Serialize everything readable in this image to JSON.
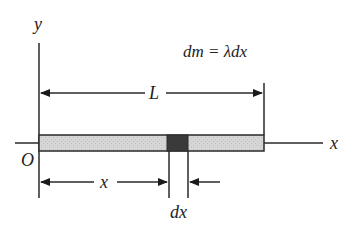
{
  "diagram": {
    "labels": {
      "y_axis": "y",
      "x_axis": "x",
      "origin": "O",
      "length": "L",
      "position": "x",
      "element_width": "dx",
      "equation": "dm = λdx"
    },
    "colors": {
      "rod_fill": "#d4d4d4",
      "element_fill": "#3a3a3a",
      "line": "#2a2a2a"
    }
  }
}
